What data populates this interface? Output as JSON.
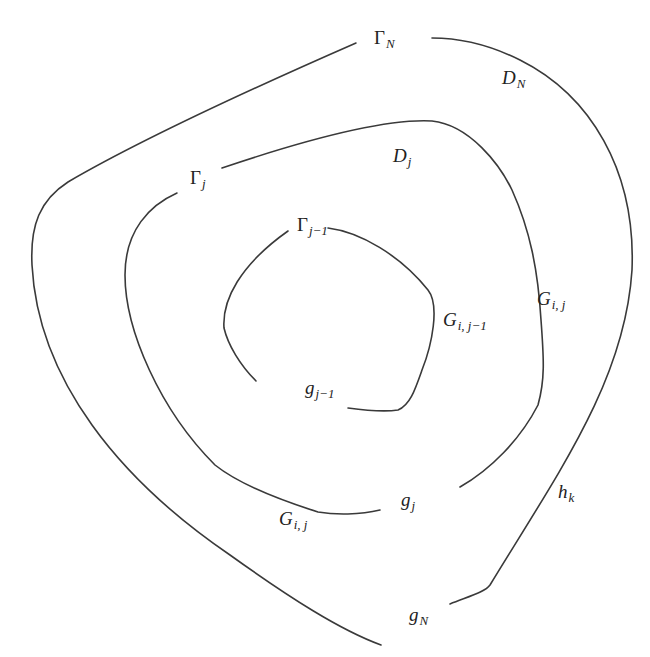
{
  "figure": {
    "stroke_color": "#3a3a3a",
    "background": "#ffffff"
  },
  "curves": {
    "outer": {
      "name": "Gamma_N",
      "gap_label": "g_N"
    },
    "middle": {
      "name": "Gamma_j",
      "gap_label": "g_j"
    },
    "inner": {
      "name": "Gamma_{j-1}",
      "gap_label": "g_{j-1}"
    }
  },
  "labels": {
    "gamma_N": {
      "main": "Γ",
      "sub": "N"
    },
    "D_N": {
      "main": "D",
      "sub": "N"
    },
    "gamma_j": {
      "main": "Γ",
      "sub": "j"
    },
    "D_j": {
      "main": "D",
      "sub": "j"
    },
    "gamma_j_minus_1": {
      "main": "Γ",
      "sub": "j−1"
    },
    "G_i_j_minus_1": {
      "main": "G",
      "sub": "i, j−1"
    },
    "G_i_j_right": {
      "main": "G",
      "sub": "i, j"
    },
    "g_j_minus_1": {
      "main": "g",
      "sub": "j−1"
    },
    "g_j": {
      "main": "g",
      "sub": "j"
    },
    "G_i_j_bottom": {
      "main": "G",
      "sub": "i, j"
    },
    "h_k": {
      "main": "h",
      "sub": "k"
    },
    "g_N": {
      "main": "g",
      "sub": "N"
    }
  }
}
